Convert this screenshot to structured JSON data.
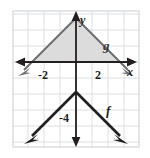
{
  "figure": {
    "title": "",
    "background": "#ffffff",
    "plot_area": {
      "x": 13,
      "y": 11,
      "width": 126,
      "height": 136
    },
    "grid": {
      "show": true,
      "spacing_px": 16,
      "color": "#d9dde0",
      "border_color": "#c8ccd0"
    },
    "axes": {
      "x_axis_label": "x",
      "y_axis_label": "y",
      "origin_px": {
        "x": 76,
        "y": 62
      },
      "unit_px": 16,
      "axis_color": "#231f20",
      "x_ticks": [
        "-2",
        "2"
      ],
      "y_ticks": [
        "-4"
      ]
    },
    "curves": [
      {
        "name": "g",
        "label": "g",
        "type": "absolute-value",
        "orientation": "downward",
        "vertex": {
          "x": 0,
          "y": 2.75
        },
        "slope": 1,
        "color": "#6d6e71",
        "stroke_width": 2,
        "label_pos_px": {
          "x": 106,
          "y": 45
        }
      },
      {
        "name": "f",
        "label": "f",
        "type": "absolute-value",
        "orientation": "downward",
        "vertex": {
          "x": 0,
          "y": -1.875
        },
        "slope": 1,
        "color": "#231f20",
        "stroke_width": 2.6,
        "label_pos_px": {
          "x": 109,
          "y": 110
        }
      }
    ],
    "shaded_region": {
      "name": "region-between-g-and-x-axis",
      "fill": "#dcdcdc",
      "description": "triangle bounded by g above the x-axis"
    },
    "tick_labels": {
      "x_neg2": "-2",
      "x_pos2": "2",
      "y_neg4": "-4"
    }
  }
}
